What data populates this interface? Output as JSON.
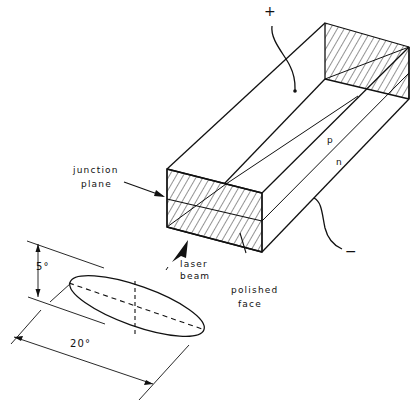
{
  "figure": {
    "type": "semiconductor laser diode schematic",
    "labels": {
      "plus_terminal": "+",
      "minus_terminal": "−",
      "p_region": "p",
      "n_region": "n",
      "junction_plane_line1": "junction",
      "junction_plane_line2": "plane",
      "laser_beam_line1": "laser",
      "laser_beam_line2": "beam",
      "polished_face_line1": "polished",
      "polished_face_line2": "face",
      "vertical_divergence": "5°",
      "horizontal_divergence": "20°"
    },
    "colors": {
      "ink": "#111111",
      "background": "#ffffff"
    }
  }
}
